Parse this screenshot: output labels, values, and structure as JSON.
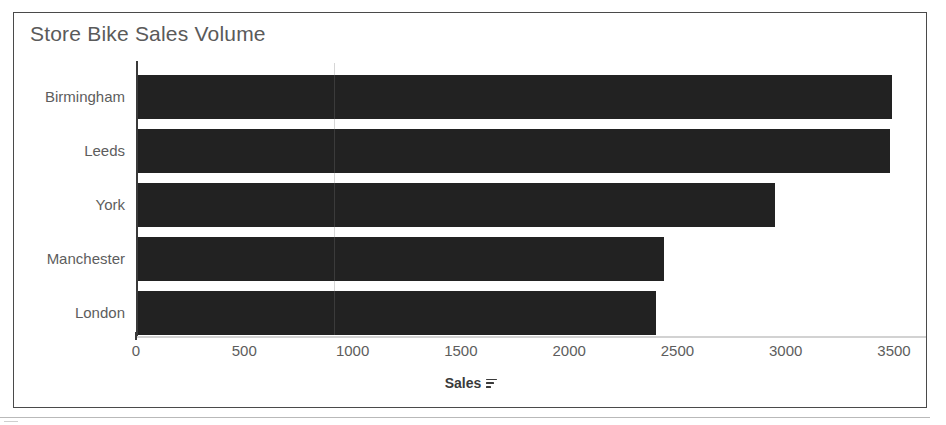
{
  "chart_data": {
    "type": "bar",
    "orientation": "horizontal",
    "title": "Store Bike Sales Volume",
    "categories": [
      "Birmingham",
      "Leeds",
      "York",
      "Manchester",
      "London"
    ],
    "values": [
      3480,
      3470,
      2940,
      2430,
      2390
    ],
    "series": [
      {
        "name": "Sales",
        "values": [
          3480,
          3470,
          2940,
          2430,
          2390
        ]
      }
    ],
    "xlabel": "Sales",
    "ylabel": "",
    "xlim": [
      0,
      3500
    ],
    "xticks": [
      0,
      500,
      1000,
      1500,
      2000,
      2500,
      3000,
      3500
    ],
    "xtick_labels": [
      "0",
      "500",
      "1000",
      "1500",
      "2000",
      "2500",
      "3000",
      "3500"
    ],
    "grid": false,
    "legend": false,
    "bar_color": "#222222",
    "sort_order": "descending"
  },
  "axis_title": {
    "label": "Sales",
    "sort_icon": "sort-descending-icon"
  },
  "colors": {
    "bar": "#222222",
    "title_text": "#5a5a5a",
    "label_text": "#5d5d5d",
    "axis_line": "#3a3a3a",
    "frame_border": "#4a4a4a",
    "background": "#ffffff"
  }
}
